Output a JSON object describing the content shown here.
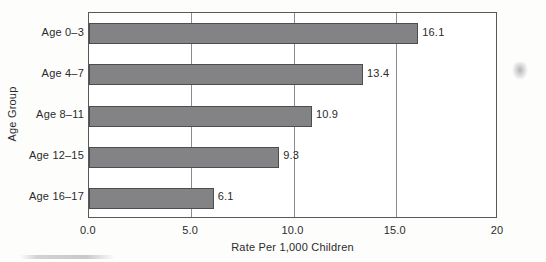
{
  "chart_data": {
    "type": "bar",
    "orientation": "horizontal",
    "title": "",
    "xlabel": "Rate Per 1,000 Children",
    "ylabel": "Age Group",
    "categories": [
      "Age 0–3",
      "Age 4–7",
      "Age 8–11",
      "Age 12–15",
      "Age 16–17"
    ],
    "values": [
      16.1,
      13.4,
      10.9,
      9.3,
      6.1
    ],
    "value_labels": [
      "16.1",
      "13.4",
      "10.9",
      "9.3",
      "6.1"
    ],
    "xlim": [
      0,
      20
    ],
    "xticks": [
      0,
      5,
      10,
      15,
      20
    ],
    "xtick_labels": [
      "0.0",
      "5.0",
      "10.0",
      "15.0",
      "20"
    ],
    "gridlines": {
      "vertical_at": [
        5,
        10,
        15
      ],
      "horizontal": false
    },
    "legend": null,
    "bar_color": "#838385",
    "bar_edge_color": "#4d4d4f",
    "frame_color": "#58585a",
    "gridline_color": "#8c8c8e",
    "background_color": "#fdfdfc",
    "text_color": "#2b2b2b"
  }
}
